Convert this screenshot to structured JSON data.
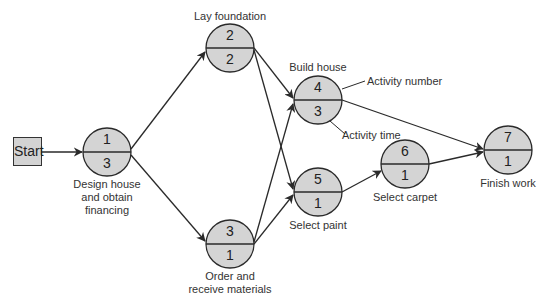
{
  "diagram": {
    "type": "activity-on-node network",
    "colors": {
      "node_fill": "#d4d4d4",
      "stroke": "#2a2a2a",
      "text": "#333333"
    },
    "start": {
      "label": "Start"
    },
    "nodes": [
      {
        "number": "1",
        "time": "3",
        "label": [
          "Design house",
          "and obtain",
          "financing"
        ]
      },
      {
        "number": "2",
        "time": "2",
        "label": [
          "Lay foundation"
        ]
      },
      {
        "number": "3",
        "time": "1",
        "label": [
          "Order and",
          "receive materials"
        ]
      },
      {
        "number": "4",
        "time": "3",
        "label": [
          "Build house"
        ]
      },
      {
        "number": "5",
        "time": "1",
        "label": [
          "Select paint"
        ]
      },
      {
        "number": "6",
        "time": "1",
        "label": [
          "Select carpet"
        ]
      },
      {
        "number": "7",
        "time": "1",
        "label": [
          "Finish work"
        ]
      }
    ],
    "edges": [
      [
        "Start",
        "1"
      ],
      [
        "1",
        "2"
      ],
      [
        "1",
        "3"
      ],
      [
        "2",
        "4"
      ],
      [
        "2",
        "5"
      ],
      [
        "3",
        "4"
      ],
      [
        "3",
        "5"
      ],
      [
        "4",
        "7"
      ],
      [
        "5",
        "6"
      ],
      [
        "6",
        "7"
      ]
    ],
    "annotations": {
      "activity_number": "Activity number",
      "activity_time": "Activity time"
    }
  }
}
